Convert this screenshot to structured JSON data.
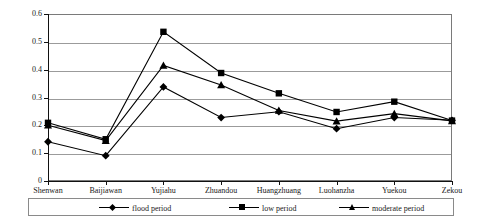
{
  "chart_data": {
    "type": "line",
    "title": "",
    "xlabel": "",
    "ylabel": "",
    "ylim": [
      0,
      0.6
    ],
    "ytick_labels": [
      "0.6",
      "0.5",
      "0.4",
      "0.3",
      "0.2",
      "0.1",
      "0"
    ],
    "ytick_values": [
      0.6,
      0.5,
      0.4,
      0.3,
      0.2,
      0.1,
      0
    ],
    "grid": true,
    "legend_position": "bottom",
    "categories": [
      "Shenwan",
      "Baijiawan",
      "Yujiahu",
      "Zhuandou",
      "Huangzhuang",
      "Luohanzha",
      "Yuekou",
      "Zekou"
    ],
    "series": [
      {
        "name": "flood period",
        "marker": "diamond",
        "values": [
          0.141,
          0.091,
          0.338,
          0.228,
          0.249,
          0.188,
          0.228,
          0.218
        ]
      },
      {
        "name": "low period",
        "marker": "square",
        "values": [
          0.209,
          0.15,
          0.536,
          0.388,
          0.315,
          0.248,
          0.285,
          0.217
        ]
      },
      {
        "name": "moderate period",
        "marker": "triangle",
        "values": [
          0.2,
          0.145,
          0.415,
          0.345,
          0.253,
          0.215,
          0.242,
          0.216
        ]
      }
    ]
  },
  "legend": {
    "items": [
      {
        "label": "flood period",
        "marker": "diamond-marker"
      },
      {
        "label": "low period",
        "marker": "square-marker"
      },
      {
        "label": "moderate period",
        "marker": "triangle-marker"
      }
    ]
  }
}
